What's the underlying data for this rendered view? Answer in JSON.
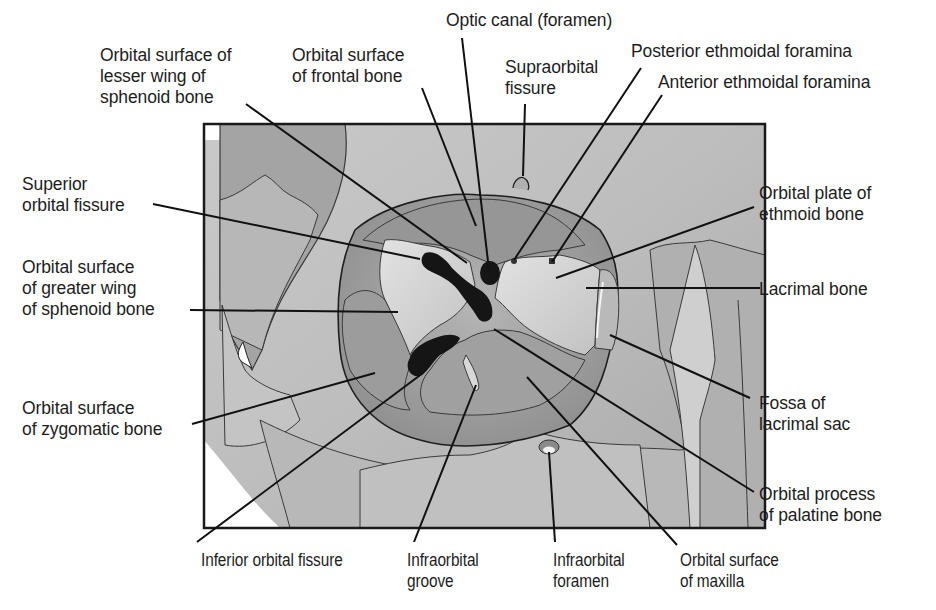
{
  "figure": {
    "type": "anatomical-diagram",
    "colors": {
      "background": "#ffffff",
      "frame": "#1a1a1a",
      "bone_light": "#d4d4d4",
      "bone_mid": "#a9a9a9",
      "bone_dark": "#8e8e8e",
      "fissure": "#141414",
      "leader_line": "#111111"
    }
  },
  "labels": {
    "lesser_wing": "Orbital surface of\nlesser wing of\nsphenoid bone",
    "frontal": "Orbital surface\nof frontal bone",
    "optic_canal": "Optic canal (foramen)",
    "supraorbital_fissure": "Supraorbital\nfissure",
    "posterior_ethmoidal": "Posterior ethmoidal foramina",
    "anterior_ethmoidal": "Anterior ethmoidal foramina",
    "superior_orbital_fissure": "Superior\norbital fissure",
    "greater_wing": "Orbital surface\nof greater wing\nof sphenoid bone",
    "zygomatic": "Orbital surface\nof zygomatic bone",
    "ethmoid_plate": "Orbital plate of\nethmoid bone",
    "lacrimal_bone": "Lacrimal bone",
    "fossa_lacrimal_sac": "Fossa of\nlacrimal sac",
    "palatine": "Orbital process\nof palatine bone",
    "inferior_orbital_fissure": "Inferior orbital fissure",
    "infraorbital_groove": "Infraorbital\ngroove",
    "infraorbital_foramen": "Infraorbital\nforamen",
    "maxilla": "Orbital surface\nof maxilla"
  }
}
